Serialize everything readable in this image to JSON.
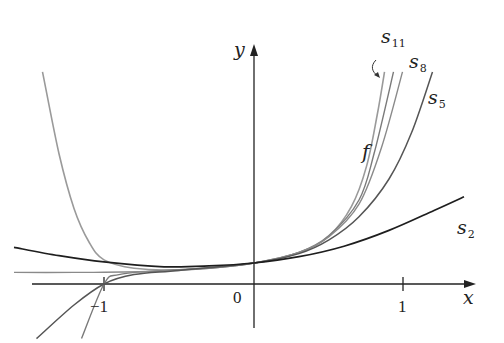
{
  "axes": {
    "x_label": "x",
    "y_label": "y",
    "ticks": {
      "neg_one": "−1",
      "zero": "0",
      "one": "1"
    }
  },
  "labels": {
    "f": "f",
    "s11": {
      "base": "s",
      "sub": "11"
    },
    "s8": {
      "base": "s",
      "sub": "8"
    },
    "s5": {
      "base": "s",
      "sub": "5"
    },
    "s2": {
      "base": "s",
      "sub": "2"
    }
  },
  "colors": {
    "axis": "#222222",
    "f": "#9a9a9a",
    "s11": "#7a7a7a",
    "s8": "#8a8a8a",
    "s5": "#555555",
    "s2": "#1e1e1e"
  },
  "chart_data": {
    "type": "line",
    "title": "",
    "xlabel": "x",
    "ylabel": "y",
    "xlim": [
      -1.6,
      1.5
    ],
    "x_ticks": [
      -1,
      0,
      1
    ],
    "tick_labels": [
      "−1",
      "0",
      "1"
    ],
    "grid": false,
    "legend": "inline labels near curve ends",
    "series": [
      {
        "name": "f",
        "points": [
          [
            -1.41,
            10.1
          ],
          [
            -1.3,
            6.2
          ],
          [
            -1.2,
            3.6
          ],
          [
            -1.1,
            2.0
          ],
          [
            -1.0,
            1.15
          ],
          [
            -0.8,
            0.75
          ],
          [
            -0.5,
            0.68
          ],
          [
            0,
            1.0
          ],
          [
            0.3,
            1.5
          ],
          [
            0.5,
            2.3
          ],
          [
            0.65,
            3.7
          ],
          [
            0.75,
            5.6
          ],
          [
            0.82,
            8.0
          ],
          [
            0.87,
            10.1
          ]
        ]
      },
      {
        "name": "s11",
        "points": [
          [
            -1.15,
            -2.6
          ],
          [
            -1.0,
            0.0
          ],
          [
            -0.9,
            0.45
          ],
          [
            -0.6,
            0.65
          ],
          [
            -0.3,
            0.75
          ],
          [
            0,
            1.0
          ],
          [
            0.3,
            1.5
          ],
          [
            0.5,
            2.3
          ],
          [
            0.7,
            4.0
          ],
          [
            0.8,
            6.2
          ],
          [
            0.93,
            10.1
          ]
        ]
      },
      {
        "name": "s8",
        "points": [
          [
            -1.6,
            0.55
          ],
          [
            -1.2,
            0.55
          ],
          [
            -1.0,
            0.56
          ],
          [
            -0.6,
            0.62
          ],
          [
            -0.3,
            0.75
          ],
          [
            0,
            1.0
          ],
          [
            0.3,
            1.5
          ],
          [
            0.5,
            2.25
          ],
          [
            0.7,
            3.8
          ],
          [
            0.85,
            6.5
          ],
          [
            0.99,
            10.1
          ]
        ]
      },
      {
        "name": "s5",
        "points": [
          [
            -1.45,
            -2.6
          ],
          [
            -1.2,
            -1.0
          ],
          [
            -1.0,
            0.0
          ],
          [
            -0.8,
            0.45
          ],
          [
            -0.5,
            0.65
          ],
          [
            0,
            1.0
          ],
          [
            0.3,
            1.45
          ],
          [
            0.5,
            2.1
          ],
          [
            0.7,
            3.2
          ],
          [
            0.9,
            5.0
          ],
          [
            1.05,
            7.2
          ],
          [
            1.19,
            10.1
          ]
        ]
      },
      {
        "name": "s2",
        "points": [
          [
            -1.6,
            1.75
          ],
          [
            -1.3,
            1.35
          ],
          [
            -1.0,
            1.05
          ],
          [
            -0.6,
            0.82
          ],
          [
            -0.3,
            0.86
          ],
          [
            0,
            1.0
          ],
          [
            0.3,
            1.3
          ],
          [
            0.6,
            1.8
          ],
          [
            0.9,
            2.55
          ],
          [
            1.2,
            3.5
          ],
          [
            1.4,
            4.15
          ]
        ]
      }
    ]
  }
}
